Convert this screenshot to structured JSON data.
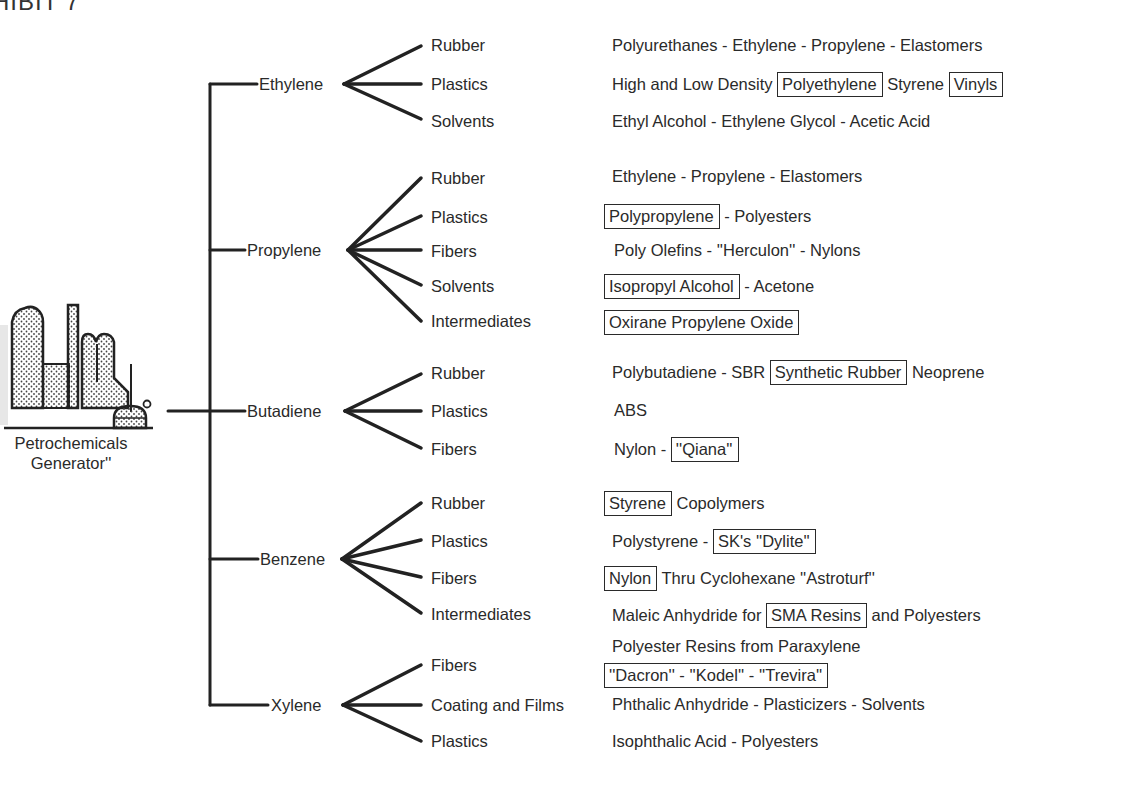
{
  "title": "HIBIT 7",
  "generator": {
    "line1": "Petrochemicals",
    "line2": "Generator''",
    "icon": "refinery-icon"
  },
  "feedstocks": [
    {
      "name": "Ethylene",
      "uses": [
        {
          "category": "Rubber",
          "products": [
            {
              "text": "Polyurethanes - Ethylene - Propylene - Elastomers",
              "boxed": false
            }
          ]
        },
        {
          "category": "Plastics",
          "products": [
            {
              "text": "High and Low Density",
              "boxed": false
            },
            {
              "text": "Polyethylene",
              "boxed": true
            },
            {
              "text": "Styrene",
              "boxed": false
            },
            {
              "text": "Vinyls",
              "boxed": true
            }
          ]
        },
        {
          "category": "Solvents",
          "products": [
            {
              "text": "Ethyl Alcohol - Ethylene Glycol - Acetic Acid",
              "boxed": false
            }
          ]
        }
      ]
    },
    {
      "name": "Propylene",
      "uses": [
        {
          "category": "Rubber",
          "products": [
            {
              "text": "Ethylene - Propylene - Elastomers",
              "boxed": false
            }
          ]
        },
        {
          "category": "Plastics",
          "products": [
            {
              "text": "Polypropylene",
              "boxed": true
            },
            {
              "text": "- Polyesters",
              "boxed": false
            }
          ]
        },
        {
          "category": "Fibers",
          "products": [
            {
              "text": "Poly Olefins - ''Herculon'' - Nylons",
              "boxed": false
            }
          ]
        },
        {
          "category": "Solvents",
          "products": [
            {
              "text": "Isopropyl Alcohol",
              "boxed": true
            },
            {
              "text": "- Acetone",
              "boxed": false
            }
          ]
        },
        {
          "category": "Intermediates",
          "products": [
            {
              "text": "Oxirane Propylene Oxide",
              "boxed": true
            }
          ]
        }
      ]
    },
    {
      "name": "Butadiene",
      "uses": [
        {
          "category": "Rubber",
          "products": [
            {
              "text": "Polybutadiene - SBR",
              "boxed": false
            },
            {
              "text": "Synthetic Rubber",
              "boxed": true
            },
            {
              "text": "Neoprene",
              "boxed": false
            }
          ]
        },
        {
          "category": "Plastics",
          "products": [
            {
              "text": "ABS",
              "boxed": false
            }
          ]
        },
        {
          "category": "Fibers",
          "products": [
            {
              "text": "Nylon -",
              "boxed": false
            },
            {
              "text": "''Qiana''",
              "boxed": true
            }
          ]
        }
      ]
    },
    {
      "name": "Benzene",
      "uses": [
        {
          "category": "Rubber",
          "products": [
            {
              "text": "Styrene",
              "boxed": true
            },
            {
              "text": "Copolymers",
              "boxed": false
            }
          ]
        },
        {
          "category": "Plastics",
          "products": [
            {
              "text": "Polystyrene -",
              "boxed": false
            },
            {
              "text": "SK's ''Dylite''",
              "boxed": true
            }
          ]
        },
        {
          "category": "Fibers",
          "products": [
            {
              "text": "Nylon",
              "boxed": true
            },
            {
              "text": "Thru Cyclohexane ''Astroturf''",
              "boxed": false
            }
          ]
        },
        {
          "category": "Intermediates",
          "products": [
            {
              "text": "Maleic Anhydride for",
              "boxed": false
            },
            {
              "text": "SMA Resins",
              "boxed": true
            },
            {
              "text": "and Polyesters",
              "boxed": false
            }
          ]
        }
      ]
    },
    {
      "name": "Xylene",
      "uses": [
        {
          "category": "Fibers",
          "products": [
            {
              "text": "Polyester Resins from Paraxylene",
              "boxed": false
            }
          ],
          "products2": [
            {
              "text": "''Dacron'' - ''Kodel'' - ''Trevira''",
              "boxed": true
            }
          ]
        },
        {
          "category": "Coating and Films",
          "products": [
            {
              "text": "Phthalic Anhydride - Plasticizers - Solvents",
              "boxed": false
            }
          ]
        },
        {
          "category": "Plastics",
          "products": [
            {
              "text": "Isophthalic Acid - Polyesters",
              "boxed": false
            }
          ]
        }
      ]
    }
  ],
  "colors": {
    "ink": "#2a2a2a",
    "background": "#ffffff"
  }
}
